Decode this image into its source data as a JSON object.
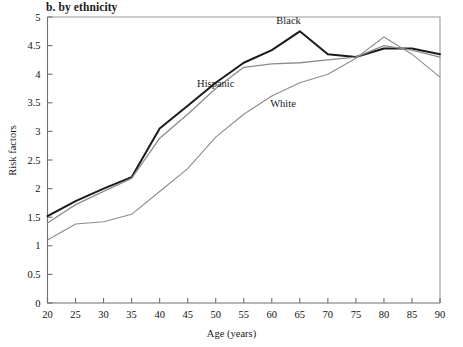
{
  "figure": {
    "title": "b. by ethnicity",
    "background": "#ffffff"
  },
  "chart_data": {
    "type": "line",
    "title": "b. by ethnicity",
    "xlabel": "Age (years)",
    "ylabel": "Risk factors",
    "xlim": [
      20,
      90
    ],
    "ylim": [
      0,
      5
    ],
    "xticks": [
      20,
      25,
      30,
      35,
      40,
      45,
      50,
      55,
      60,
      65,
      70,
      75,
      80,
      85,
      90
    ],
    "yticks": [
      0,
      0.5,
      1,
      1.5,
      2,
      2.5,
      3,
      3.5,
      4,
      4.5,
      5
    ],
    "xtick_labels": [
      "20",
      "25",
      "30",
      "35",
      "40",
      "45",
      "50",
      "55",
      "60",
      "65",
      "70",
      "75",
      "80",
      "85",
      "90"
    ],
    "ytick_labels": [
      "0",
      "0.5",
      "1",
      "1.5",
      "2",
      "2.5",
      "3",
      "3.5",
      "4",
      "4.5",
      "5"
    ],
    "grid": false,
    "legend_position": "inline-annotations",
    "x": [
      20,
      25,
      30,
      35,
      40,
      45,
      50,
      55,
      60,
      65,
      70,
      75,
      80,
      85,
      90
    ],
    "series": [
      {
        "name": "Black",
        "color": "#1a1a1a",
        "line_width": 2.0,
        "label_x": 63,
        "label_y": 4.88,
        "values": [
          1.52,
          1.78,
          2.0,
          2.2,
          3.05,
          3.45,
          3.85,
          4.2,
          4.42,
          4.75,
          4.35,
          4.3,
          4.45,
          4.45,
          4.35
        ]
      },
      {
        "name": "Hispanic",
        "color": "#8c8c8c",
        "line_width": 1.3,
        "label_x": 50,
        "label_y": 3.78,
        "values": [
          1.4,
          1.72,
          1.95,
          2.18,
          2.88,
          3.3,
          3.75,
          4.12,
          4.18,
          4.2,
          4.25,
          4.3,
          4.5,
          4.42,
          4.3
        ]
      },
      {
        "name": "White",
        "color": "#8c8c8c",
        "line_width": 1.1,
        "label_x": 62,
        "label_y": 3.42,
        "values": [
          1.1,
          1.38,
          1.42,
          1.55,
          1.95,
          2.35,
          2.9,
          3.3,
          3.62,
          3.85,
          4.0,
          4.28,
          4.65,
          4.35,
          3.95
        ]
      }
    ],
    "annotations": [
      {
        "text": "Black",
        "x": 63,
        "y": 4.88
      },
      {
        "text": "Hispanic",
        "x": 50,
        "y": 3.78
      },
      {
        "text": "White",
        "x": 62,
        "y": 3.42
      }
    ]
  },
  "axes": {
    "frame_color": "#9a9a9a",
    "axis_color": "#6e6e6e",
    "tick_color": "#6e6e6e"
  }
}
